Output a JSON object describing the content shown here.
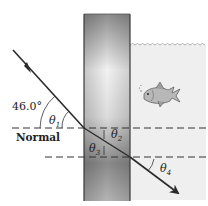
{
  "figure": {
    "incident_angle_label": "46.0°",
    "normal_label": "Normal",
    "angles": [
      {
        "symbol": "θ",
        "sub": "1"
      },
      {
        "symbol": "θ",
        "sub": "2"
      },
      {
        "symbol": "θ",
        "sub": "3"
      },
      {
        "symbol": "θ",
        "sub": "4"
      }
    ],
    "media": {
      "left": "air",
      "middle": "glass slab",
      "right": "water (aquarium with fish)"
    },
    "colors": {
      "ray": "#2b2b2b",
      "water": "#efefef",
      "glass_edge": "#3a3a3a"
    }
  }
}
